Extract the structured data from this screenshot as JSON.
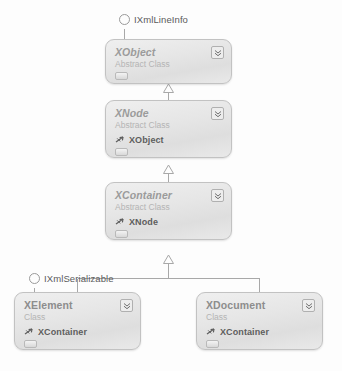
{
  "diagram": {
    "colors": {
      "box_border": "#c2c2c2",
      "box_fill_top": "#efefef",
      "box_fill_bottom": "#e9e9e9",
      "class_name_text": "#8d8d8d",
      "kind_text": "#b4b4b4",
      "member_text": "#5d5d5d",
      "connector": "#a8a8a8",
      "interface_label": "#5b5b5b",
      "canvas": "#fdfdfd"
    },
    "interfaces": [
      {
        "name": "IXmlLineInfo",
        "icon": "lollipop-circle-icon",
        "attached_to": "XObject"
      },
      {
        "name": "IXmlSerializable",
        "icon": "lollipop-circle-icon",
        "attached_to": "XElement"
      }
    ],
    "classes": [
      {
        "id": "xobject",
        "name": "XObject",
        "kind": "Abstract Class",
        "abstract": true,
        "collapse_icon": "double-chevron-down-icon",
        "footer_icon": "collapsed-section-handle-icon",
        "members": []
      },
      {
        "id": "xnode",
        "name": "XNode",
        "kind": "Abstract Class",
        "abstract": true,
        "collapse_icon": "double-chevron-down-icon",
        "footer_icon": "collapsed-section-handle-icon",
        "members": [
          {
            "label": "XObject",
            "icon": "base-type-arrow-icon"
          }
        ]
      },
      {
        "id": "xcontainer",
        "name": "XContainer",
        "kind": "Abstract Class",
        "abstract": true,
        "collapse_icon": "double-chevron-down-icon",
        "footer_icon": "collapsed-section-handle-icon",
        "members": [
          {
            "label": "XNode",
            "icon": "base-type-arrow-icon"
          }
        ]
      },
      {
        "id": "xelement",
        "name": "XElement",
        "kind": "Class",
        "abstract": false,
        "collapse_icon": "double-chevron-down-icon",
        "footer_icon": "collapsed-section-handle-icon",
        "members": [
          {
            "label": "XContainer",
            "icon": "base-type-arrow-icon"
          }
        ]
      },
      {
        "id": "xdocument",
        "name": "XDocument",
        "kind": "Class",
        "abstract": false,
        "collapse_icon": "double-chevron-down-icon",
        "footer_icon": "collapsed-section-handle-icon",
        "members": [
          {
            "label": "XContainer",
            "icon": "base-type-arrow-icon"
          }
        ]
      }
    ],
    "relationships": [
      {
        "type": "generalization",
        "from": "XNode",
        "to": "XObject"
      },
      {
        "type": "generalization",
        "from": "XContainer",
        "to": "XNode"
      },
      {
        "type": "generalization",
        "from": "XElement",
        "to": "XContainer"
      },
      {
        "type": "generalization",
        "from": "XDocument",
        "to": "XContainer"
      }
    ]
  }
}
